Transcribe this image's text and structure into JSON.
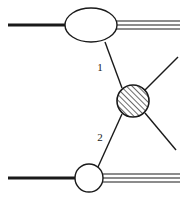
{
  "diagram": {
    "background_color": "#ffffff",
    "line_color": "#1a1a1a",
    "hatch_color": "#1a1a1a",
    "blob_fill": "#ffffff",
    "labels": [
      {
        "id": "propagator-1",
        "text": "1",
        "x": 100,
        "y": 71
      },
      {
        "id": "propagator-2",
        "text": "2",
        "x": 100,
        "y": 141
      }
    ],
    "nodes": {
      "top_ellipse": {
        "name": "top-blob",
        "cx": 91,
        "cy": 25,
        "rx": 26,
        "ry": 17
      },
      "center_circle": {
        "name": "hatched-vertex-blob",
        "cx": 133,
        "cy": 101,
        "r": 16
      },
      "bottom_circle": {
        "name": "bottom-blob",
        "cx": 89,
        "cy": 178,
        "r": 14
      }
    },
    "edges": {
      "top_incoming": {
        "name": "top-incoming-line",
        "x1": 8,
        "y1": 25,
        "x2": 66,
        "y2": 25,
        "width": 3
      },
      "top_outgoing": [
        {
          "x1": 116,
          "y1": 21,
          "x2": 180,
          "y2": 21
        },
        {
          "x1": 117,
          "y1": 25,
          "x2": 180,
          "y2": 25
        },
        {
          "x1": 116,
          "y1": 29,
          "x2": 180,
          "y2": 29
        }
      ],
      "bottom_incoming": {
        "name": "bottom-incoming-line",
        "x1": 8,
        "y1": 178,
        "x2": 76,
        "y2": 178,
        "width": 3
      },
      "bottom_outgoing": [
        {
          "x1": 102,
          "y1": 174,
          "x2": 180,
          "y2": 174
        },
        {
          "x1": 103,
          "y1": 178,
          "x2": 180,
          "y2": 178
        },
        {
          "x1": 102,
          "y1": 182,
          "x2": 180,
          "y2": 182
        }
      ],
      "propagator_1": {
        "name": "propagator-line-1",
        "x1": 105,
        "y1": 42,
        "x2": 122,
        "y2": 88
      },
      "propagator_2": {
        "name": "propagator-line-2",
        "x1": 98,
        "y1": 167,
        "x2": 122,
        "y2": 114
      },
      "vertex_out_upper": {
        "name": "vertex-outgoing-upper-line",
        "x1": 145,
        "y1": 90,
        "x2": 178,
        "y2": 57
      },
      "vertex_out_lower": {
        "name": "vertex-outgoing-lower-line",
        "x1": 145,
        "y1": 113,
        "x2": 176,
        "y2": 150
      }
    }
  }
}
